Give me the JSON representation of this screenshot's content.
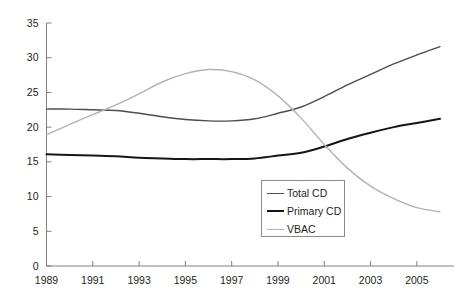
{
  "chart_data": {
    "type": "line",
    "title": "",
    "subtitle": "",
    "xlabel": "",
    "ylabel": "",
    "xlim": [
      1989,
      2006
    ],
    "ylim": [
      0,
      35
    ],
    "yticks": [
      0,
      5,
      10,
      15,
      20,
      25,
      30,
      35
    ],
    "xticks": [
      1989,
      1991,
      1993,
      1995,
      1997,
      1999,
      2001,
      2003,
      2005
    ],
    "xtick_labels": [
      "1989",
      "1991",
      "1993",
      "1995",
      "1997",
      "1999",
      "2001",
      "2003",
      "2005"
    ],
    "ytick_labels": [
      "0",
      "5",
      "10",
      "15",
      "20",
      "25",
      "30",
      "35"
    ],
    "grid": false,
    "legend_position": "inside-bottom-right",
    "x": [
      1989,
      1990,
      1991,
      1992,
      1993,
      1994,
      1995,
      1996,
      1997,
      1998,
      1999,
      2000,
      2001,
      2002,
      2003,
      2004,
      2005,
      2006
    ],
    "series": [
      {
        "name": "Total CD",
        "color": "#4d4d4d",
        "width": 1.4,
        "values": [
          22.6,
          22.6,
          22.5,
          22.4,
          22.0,
          21.5,
          21.1,
          20.9,
          20.9,
          21.2,
          22.0,
          22.9,
          24.4,
          26.1,
          27.6,
          29.1,
          30.4,
          31.6
        ]
      },
      {
        "name": "Primary CD",
        "color": "#151515",
        "width": 2.0,
        "values": [
          16.1,
          16.0,
          15.9,
          15.8,
          15.6,
          15.5,
          15.4,
          15.4,
          15.4,
          15.5,
          15.9,
          16.3,
          17.2,
          18.3,
          19.2,
          20.0,
          20.6,
          21.2
        ]
      },
      {
        "name": "VBAC",
        "color": "#b3b3b3",
        "width": 1.4,
        "values": [
          18.9,
          20.4,
          21.8,
          23.2,
          24.8,
          26.5,
          27.7,
          28.3,
          28.0,
          26.8,
          24.5,
          21.3,
          17.5,
          14.1,
          11.5,
          9.7,
          8.4,
          7.8
        ]
      }
    ]
  },
  "legend": {
    "entries": [
      {
        "label": "Total CD"
      },
      {
        "label": "Primary CD"
      },
      {
        "label": "VBAC"
      }
    ]
  },
  "axes": {
    "axis_color": "#808080",
    "tick_color": "#808080"
  }
}
